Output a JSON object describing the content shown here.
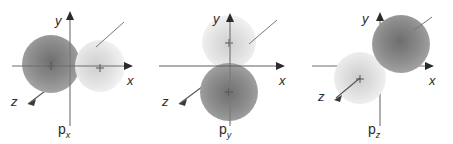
{
  "figure": {
    "background_color": "#ffffff",
    "panels": [
      {
        "id": "px",
        "orbital_label": "p",
        "orbital_subscript": "x",
        "axes": [
          {
            "name": "y",
            "label": "y",
            "direction": "up"
          },
          {
            "name": "x",
            "label": "x",
            "direction": "right"
          },
          {
            "name": "z",
            "label": "z",
            "direction": "down-left"
          }
        ],
        "lobes": [
          {
            "position": "left",
            "shade": "dark",
            "color": "#8a8a8a"
          },
          {
            "position": "right",
            "shade": "light",
            "color": "#e4e4e4"
          }
        ],
        "pointer_line": "upper-right"
      },
      {
        "id": "py",
        "orbital_label": "p",
        "orbital_subscript": "y",
        "axes": [
          {
            "name": "y",
            "label": "y",
            "direction": "up"
          },
          {
            "name": "x",
            "label": "x",
            "direction": "right"
          },
          {
            "name": "z",
            "label": "z",
            "direction": "down-left"
          }
        ],
        "lobes": [
          {
            "position": "top",
            "shade": "light",
            "color": "#e4e4e4"
          },
          {
            "position": "bottom",
            "shade": "dark",
            "color": "#8a8a8a"
          }
        ],
        "pointer_line": "upper-right"
      },
      {
        "id": "pz",
        "orbital_label": "p",
        "orbital_subscript": "z",
        "axes": [
          {
            "name": "y",
            "label": "y",
            "direction": "up"
          },
          {
            "name": "x",
            "label": "x",
            "direction": "right"
          },
          {
            "name": "z",
            "label": "z",
            "direction": "down-left"
          }
        ],
        "lobes": [
          {
            "position": "upper-right",
            "shade": "dark",
            "color": "#8a8a8a"
          },
          {
            "position": "lower-left",
            "shade": "light",
            "color": "#e4e4e4"
          }
        ],
        "pointer_line": "upper-right"
      }
    ],
    "colors": {
      "axis": "#6e6e6e",
      "axis_dark": "#3a3a3a",
      "text": "#2b2b2b",
      "lobe_dark": "#8a8a8a",
      "lobe_light": "#e4e4e4"
    }
  }
}
